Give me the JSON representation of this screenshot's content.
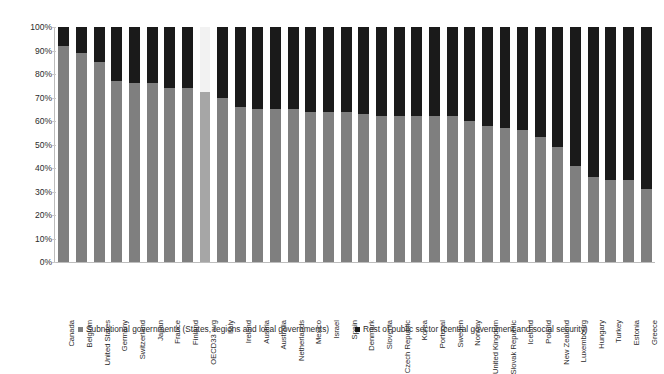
{
  "chart_data": {
    "type": "bar",
    "subtype": "stacked-100-percent",
    "title": "",
    "xlabel": "",
    "ylabel": "",
    "ylim": [
      0,
      100
    ],
    "grid": false,
    "legend_position": "bottom",
    "y_ticks": [
      "0%",
      "10%",
      "20%",
      "30%",
      "40%",
      "50%",
      "60%",
      "70%",
      "80%",
      "90%",
      "100%"
    ],
    "y_tick_values": [
      0,
      10,
      20,
      30,
      40,
      50,
      60,
      70,
      80,
      90,
      100
    ],
    "categories": [
      "Canada",
      "Belgium",
      "United States",
      "Germany",
      "Switzerland",
      "Japan",
      "France",
      "Finland",
      "OECD33 avg",
      "Italy",
      "Ireland",
      "Austria",
      "Australia",
      "Netherlands",
      "Mexico",
      "Israel",
      "Spain",
      "Denmark",
      "Slovenia",
      "Czech Republic",
      "Korea",
      "Portugal",
      "Sweden",
      "Norway",
      "United Kingdom",
      "Slovak Republic",
      "Iceland",
      "Poland",
      "New Zealand",
      "Luxembourg",
      "Hungary",
      "Turkey",
      "Estonia",
      "Greece"
    ],
    "highlight_category": "OECD33 avg",
    "series": [
      {
        "name": "Subnational governments (States, regions and local governments)",
        "color": "#7f7f7f",
        "highlight_color": "#a6a6a6",
        "values": [
          92,
          89,
          85,
          77,
          76,
          76,
          74,
          74,
          72.5,
          70,
          66,
          65,
          65,
          65,
          64,
          64,
          64,
          63,
          62,
          62,
          62,
          62,
          62,
          60,
          58,
          57,
          56,
          53,
          49,
          41,
          36,
          35,
          35,
          31
        ]
      },
      {
        "name": "Rest of public sector (central government and social security)",
        "color": "#1a1a1a",
        "highlight_color": "#f2f2f2",
        "values": [
          8,
          11,
          15,
          23,
          24,
          24,
          26,
          26,
          27.5,
          30,
          34,
          35,
          35,
          35,
          36,
          36,
          36,
          37,
          38,
          38,
          38,
          38,
          38,
          40,
          42,
          43,
          44,
          47,
          51,
          59,
          64,
          65,
          65,
          69
        ]
      }
    ],
    "legend": [
      {
        "label": "Subnational governments (States, regions and local governments)",
        "color": "#7f7f7f"
      },
      {
        "label": "Rest of public sector (central government and social security)",
        "color": "#1a1a1a"
      }
    ]
  }
}
